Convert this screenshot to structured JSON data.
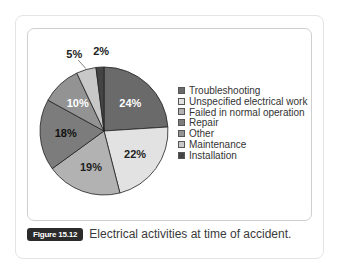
{
  "chart_data": {
    "type": "pie",
    "title": "Electrical activities at time of accident.",
    "figure_label": "Figure 15.12",
    "start_angle": "12 o'clock",
    "direction": "clockwise",
    "categories": [
      "Troubleshooting",
      "Unspecified electrical work",
      "Failed in normal operation",
      "Repair",
      "Other",
      "Maintenance",
      "Installation"
    ],
    "values": [
      24,
      22,
      19,
      18,
      10,
      5,
      2
    ],
    "labels": [
      "24%",
      "22%",
      "19%",
      "18%",
      "10%",
      "5%",
      "2%"
    ],
    "colors": [
      "#6a6a6a",
      "#e2e2e2",
      "#b2b2b2",
      "#7c7c7c",
      "#939393",
      "#c8c8c8",
      "#444444"
    ],
    "label_colors": [
      "#ffffff",
      "#222222",
      "#222222",
      "#111111",
      "#ffffff",
      "#222222",
      "#222222"
    ],
    "legend_position": "right"
  },
  "legend": {
    "items": [
      {
        "label": "Troubleshooting"
      },
      {
        "label": "Unspecified electrical work"
      },
      {
        "label": "Failed in normal operation"
      },
      {
        "label": "Repair"
      },
      {
        "label": "Other"
      },
      {
        "label": "Maintenance"
      },
      {
        "label": "Installation"
      }
    ]
  },
  "caption": {
    "figure_label": "Figure 15.12",
    "text": "Electrical activities at time of accident."
  }
}
